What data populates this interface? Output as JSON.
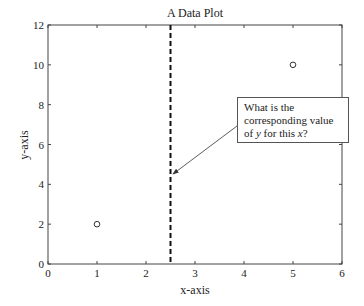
{
  "chart_data": {
    "type": "scatter",
    "title": "A Data Plot",
    "xlabel": "x-axis",
    "ylabel": "y-axis",
    "xlim": [
      0,
      6
    ],
    "ylim": [
      0,
      12
    ],
    "xticks": [
      "0",
      "1",
      "2",
      "3",
      "4",
      "5",
      "6"
    ],
    "yticks": [
      "0",
      "2",
      "4",
      "6",
      "8",
      "10",
      "12"
    ],
    "grid": false,
    "series": [
      {
        "name": "data",
        "marker": "o",
        "points": [
          {
            "x": 1,
            "y": 2
          },
          {
            "x": 5,
            "y": 10
          }
        ]
      }
    ],
    "vertical_line": {
      "x": 2.5,
      "style": "dashed"
    },
    "annotation": {
      "lines": [
        "What is the",
        "corresponding value",
        "of y for this x?"
      ],
      "points_to": {
        "x": 2.5,
        "y": 5.8
      }
    }
  }
}
